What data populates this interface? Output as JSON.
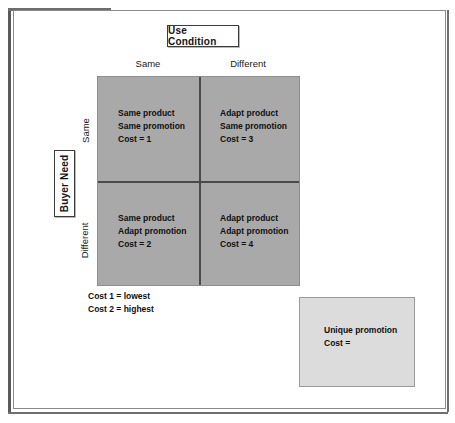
{
  "diagram": {
    "column_axis_title": "Use Condition",
    "row_axis_title": "Buyer Need",
    "column_headers": [
      "Same",
      "Different"
    ],
    "row_headers": [
      "Same",
      "Different"
    ],
    "cells": [
      {
        "line1": "Same product",
        "line2": "Same promotion",
        "line3": "Cost = 1"
      },
      {
        "line1": "Adapt product",
        "line2": "Same promotion",
        "line3": "Cost = 3"
      },
      {
        "line1": "Same product",
        "line2": "Adapt promotion",
        "line3": "Cost = 2"
      },
      {
        "line1": "Adapt product",
        "line2": "Adapt promotion",
        "line3": "Cost = 4"
      }
    ],
    "legend": {
      "line1": "Cost 1 = lowest",
      "line2": "Cost 2 = highest"
    },
    "unique_box": {
      "line1": "Unique promotion",
      "line2": "Cost ="
    },
    "colors": {
      "matrix_fill": "#a9a9a9",
      "unique_box_fill": "#dcdcdc",
      "divider": "#4a4a4a",
      "text": "#101010"
    }
  }
}
